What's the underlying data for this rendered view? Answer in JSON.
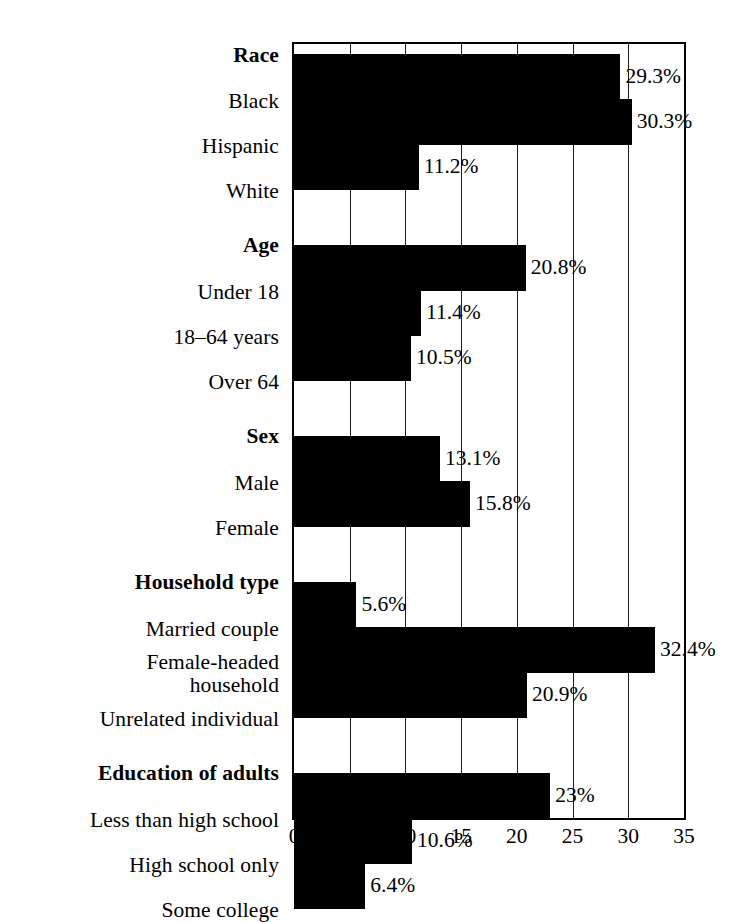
{
  "chart_data": {
    "type": "bar",
    "orientation": "horizontal",
    "title": "",
    "xlabel": "",
    "ylabel": "",
    "xlim": [
      0,
      35
    ],
    "xticks": [
      0,
      5,
      10,
      15,
      20,
      25,
      30,
      35
    ],
    "xtick_labels": [
      "0",
      "5",
      "10",
      "15",
      "20",
      "25",
      "30",
      "35"
    ],
    "grid": true,
    "grid_axis": "x",
    "legend": false,
    "value_suffix": "%",
    "bar_color": "#000000",
    "background_color": "#FFFFFF",
    "categories": [
      "Black",
      "Hispanic",
      "White",
      "Under 18",
      "18–64 years",
      "Over 64",
      "Male",
      "Female",
      "Married couple",
      "Female-headed household",
      "Unrelated individual",
      "Less than high school",
      "High school only",
      "Some college"
    ],
    "values": [
      29.3,
      30.3,
      11.2,
      20.8,
      11.4,
      10.5,
      13.1,
      15.8,
      5.6,
      32.4,
      20.9,
      23,
      10.6,
      6.4
    ],
    "value_labels": [
      "29.3%",
      "30.3%",
      "11.2%",
      "20.8%",
      "11.4%",
      "10.5%",
      "13.1%",
      "15.8%",
      "5.6%",
      "32.4%",
      "20.9%",
      "23%",
      "10.6%",
      "6.4%"
    ],
    "groups": [
      {
        "name": "Race",
        "categories": [
          "Black",
          "Hispanic",
          "White"
        ]
      },
      {
        "name": "Age",
        "categories": [
          "Under 18",
          "18–64 years",
          "Over 64"
        ]
      },
      {
        "name": "Sex",
        "categories": [
          "Male",
          "Female"
        ]
      },
      {
        "name": "Household type",
        "categories": [
          "Married couple",
          "Female-headed household",
          "Unrelated individual"
        ]
      },
      {
        "name": "Education of adults",
        "categories": [
          "Less than high school",
          "High school only",
          "Some college"
        ]
      }
    ]
  },
  "rows": [
    {
      "label": "Race",
      "kind": "group",
      "value": null,
      "value_label": null,
      "label_top": 2,
      "bar_top": null,
      "bar_height": null
    },
    {
      "label": "Black",
      "kind": "item",
      "value": 29.3,
      "value_label": "29.3%",
      "label_top": 48,
      "bar_top": 10,
      "bar_height": 46
    },
    {
      "label": "Hispanic",
      "kind": "item",
      "value": 30.3,
      "value_label": "30.3%",
      "label_top": 93,
      "bar_top": 55,
      "bar_height": 46
    },
    {
      "label": "White",
      "kind": "item",
      "value": 11.2,
      "value_label": "11.2%",
      "label_top": 138,
      "bar_top": 100,
      "bar_height": 46
    },
    {
      "label": "Age",
      "kind": "group",
      "value": null,
      "value_label": null,
      "label_top": 192,
      "bar_top": null,
      "bar_height": null
    },
    {
      "label": "Under 18",
      "kind": "item",
      "value": 20.8,
      "value_label": "20.8%",
      "label_top": 239,
      "bar_top": 201,
      "bar_height": 46
    },
    {
      "label": "18–64 years",
      "kind": "item",
      "value": 11.4,
      "value_label": "11.4%",
      "label_top": 284,
      "bar_top": 246,
      "bar_height": 46
    },
    {
      "label": "Over 64",
      "kind": "item",
      "value": 10.5,
      "value_label": "10.5%",
      "label_top": 329,
      "bar_top": 291,
      "bar_height": 46
    },
    {
      "label": "Sex",
      "kind": "group",
      "value": null,
      "value_label": null,
      "label_top": 383,
      "bar_top": null,
      "bar_height": null
    },
    {
      "label": "Male",
      "kind": "item",
      "value": 13.1,
      "value_label": "13.1%",
      "label_top": 430,
      "bar_top": 392,
      "bar_height": 46
    },
    {
      "label": "Female",
      "kind": "item",
      "value": 15.8,
      "value_label": "15.8%",
      "label_top": 475,
      "bar_top": 437,
      "bar_height": 46
    },
    {
      "label": "Household type",
      "kind": "group",
      "value": null,
      "value_label": null,
      "label_top": 529,
      "bar_top": null,
      "bar_height": null
    },
    {
      "label": "Married couple",
      "kind": "item",
      "value": 5.6,
      "value_label": "5.6%",
      "label_top": 576,
      "bar_top": 538,
      "bar_height": 46
    },
    {
      "label": "Female-headed\nhousehold",
      "kind": "item",
      "value": 32.4,
      "value_label": "32.4%",
      "label_top": 609,
      "bar_top": 583,
      "bar_height": 46
    },
    {
      "label": "Unrelated individual",
      "kind": "item",
      "value": 20.9,
      "value_label": "20.9%",
      "label_top": 666,
      "bar_top": 628,
      "bar_height": 46
    },
    {
      "label": "Education of adults",
      "kind": "group",
      "value": null,
      "value_label": null,
      "label_top": 720,
      "bar_top": null,
      "bar_height": null
    },
    {
      "label": "Less than high school",
      "kind": "item",
      "value": 23,
      "value_label": "23%",
      "label_top": 767,
      "bar_top": 729,
      "bar_height": 46
    },
    {
      "label": "High school only",
      "kind": "item",
      "value": 10.6,
      "value_label": "10.6%",
      "label_top": 812,
      "bar_top": 774,
      "bar_height": 46
    },
    {
      "label": "Some college",
      "kind": "item",
      "value": 6.4,
      "value_label": "6.4%",
      "label_top": 857,
      "bar_top": 819,
      "bar_height": 46
    }
  ],
  "axis": {
    "ticks": [
      "0",
      "5",
      "10",
      "15",
      "20",
      "25",
      "30",
      "35"
    ]
  }
}
